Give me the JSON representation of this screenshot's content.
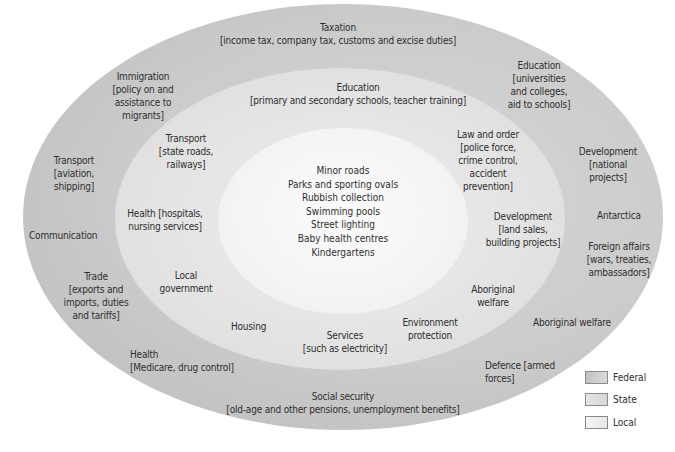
{
  "colors": {
    "federal": "#c4c4c4",
    "state": "#e0e0e0",
    "local": "#f4f4f4"
  },
  "federal": {
    "taxation": "Taxation\n[income tax, company tax, customs and excise duties]",
    "immigration": "Immigration\n[policy on and\nassistance to\nmigrants]",
    "education": "Education\n[universities\nand colleges,\naid to schools]",
    "transport": "Transport\n[aviation,\nshipping]",
    "development": "Development\n[national\nprojects]",
    "communication": "Communication",
    "antarctica": "Antarctica",
    "foreign_affairs": "Foreign affairs\n[wars, treaties,\nambassadors]",
    "trade": "Trade\n[exports and\nimports, duties\nand tariffs]",
    "aboriginal_welfare": "Aboriginal welfare",
    "health": "Health\n[Medicare, drug control]",
    "defence": "Defence [armed\nforces]",
    "social_security": "Social security\n[old-age and other pensions, unemployment benefits]"
  },
  "state": {
    "education": "Education\n[primary and secondary schools, teacher training]",
    "transport": "Transport\n[state roads,\nrailways]",
    "law_and_order": "Law and order\n[police force,\ncrime control,\naccident\nprevention]",
    "health": "Health [hospitals,\nnursing services]",
    "development": "Development\n[land sales,\nbuilding projects]",
    "local_government": "Local\ngovernment",
    "aboriginal_welfare": "Aboriginal\nwelfare",
    "housing": "Housing",
    "environment": "Environment\nprotection",
    "services": "Services\n[such as electricity]"
  },
  "local": {
    "items": [
      "Minor roads",
      "Parks and sporting ovals",
      "Rubbish collection",
      "Swimming pools",
      "Street lighting",
      "Baby health centres",
      "Kindergartens"
    ]
  },
  "legend": {
    "items": [
      {
        "label": "Federal",
        "color": "#c4c4c4"
      },
      {
        "label": "State",
        "color": "#e0e0e0"
      },
      {
        "label": "Local",
        "color": "#f4f4f4"
      }
    ]
  }
}
